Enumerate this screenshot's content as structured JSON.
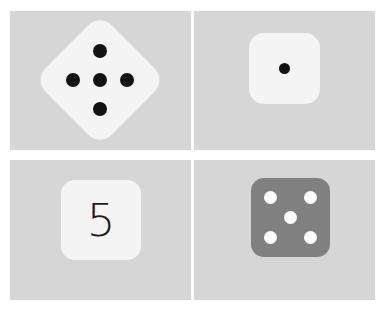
{
  "figure": {
    "background_color": "#ffffff",
    "panel_background_color": "#d6d6d6",
    "grid": {
      "rows": 2,
      "columns": 2
    }
  },
  "panels": [
    {
      "position": "top-left",
      "name": "rotated-die-five",
      "representation": "pips",
      "value": 5,
      "die_color": "#f4f4f4",
      "pip_color": "#121212",
      "rotation_degrees": 45,
      "pip_layout": [
        "top",
        "left",
        "center",
        "right",
        "bottom"
      ],
      "pips": [
        {
          "name": "pip-top"
        },
        {
          "name": "pip-left"
        },
        {
          "name": "pip-center"
        },
        {
          "name": "pip-right"
        },
        {
          "name": "pip-bottom"
        }
      ]
    },
    {
      "position": "top-right",
      "name": "die-one",
      "representation": "pips",
      "value": 1,
      "die_color": "#f4f4f4",
      "pip_color": "#121212",
      "rotation_degrees": 0,
      "pip_layout": [
        "center"
      ],
      "pips": [
        {
          "name": "pip-center"
        }
      ]
    },
    {
      "position": "bottom-left",
      "name": "numeral-card-five",
      "representation": "numeral",
      "value": 5,
      "numeral_text": "5",
      "die_color": "#f4f4f4",
      "text_color": "#1c1c1c",
      "rotation_degrees": 0
    },
    {
      "position": "bottom-right",
      "name": "gray-die-five",
      "representation": "pips",
      "value": 5,
      "die_color": "#808080",
      "pip_color": "#ffffff",
      "rotation_degrees": 0,
      "pip_layout": [
        "top-left",
        "top-right",
        "center",
        "bottom-left",
        "bottom-right"
      ],
      "pips": [
        {
          "name": "pip-top-left"
        },
        {
          "name": "pip-top-right"
        },
        {
          "name": "pip-center"
        },
        {
          "name": "pip-bottom-left"
        },
        {
          "name": "pip-bottom-right"
        }
      ]
    }
  ]
}
